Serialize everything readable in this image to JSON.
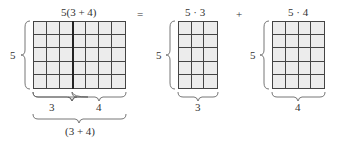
{
  "diagram": {
    "left": {
      "top_label": "5(3 + 4)",
      "side_label": "5",
      "rows": 5,
      "cols": 7,
      "split_at": 3,
      "bottom_labels": [
        "3",
        "4"
      ],
      "total_label": "(3 + 4)"
    },
    "equals": "=",
    "middle": {
      "top_label": "5 · 3",
      "side_label": "5",
      "rows": 5,
      "cols": 3,
      "bottom_label": "3"
    },
    "plus": "+",
    "right": {
      "top_label": "5 · 4",
      "side_label": "5",
      "rows": 5,
      "cols": 4,
      "bottom_label": "4"
    }
  }
}
